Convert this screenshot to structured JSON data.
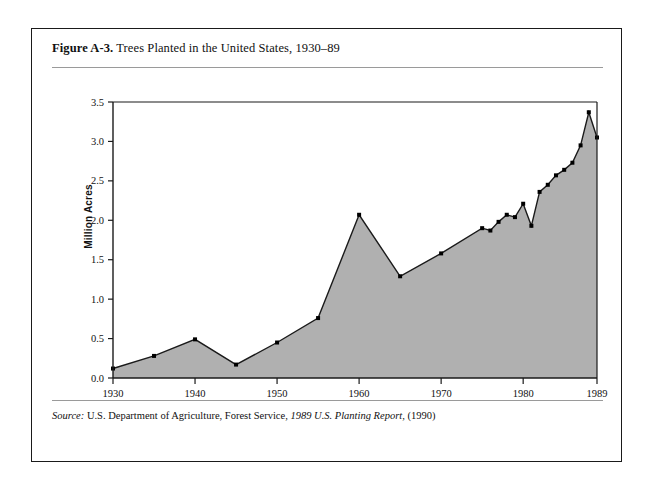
{
  "figure": {
    "label": "Figure A-3.",
    "title": "Trees Planted in the United States, 1930–89",
    "full_caption": "Figure A-3. Trees Planted in the United States, 1930–89"
  },
  "source": {
    "prefix": "Source:",
    "agency": "U.S. Department of Agriculture, Forest Service,",
    "publication": "1989 U.S. Planting Report,",
    "year": "(1990)",
    "full_text": "Source: U.S. Department of Agriculture, Forest Service, 1989 U.S. Planting Report, (1990)"
  },
  "colors": {
    "area_fill": "#b0b0b0",
    "line": "#1a1a1a",
    "marker": "#000000",
    "frame": "#1a1a1a",
    "rule": "#9a9a9a",
    "page_background": "#ffffff"
  },
  "chart_data": {
    "type": "area",
    "title": "Trees Planted in the United States, 1930–89",
    "xlabel": "",
    "ylabel": "Million Acres",
    "xlim": [
      1930,
      1989
    ],
    "ylim": [
      0.0,
      3.5
    ],
    "grid": false,
    "legend": false,
    "y_ticks": [
      "0.0",
      "0.5",
      "1.0",
      "1.5",
      "2.0",
      "2.5",
      "3.0",
      "3.5"
    ],
    "y_tick_values": [
      0.0,
      0.5,
      1.0,
      1.5,
      2.0,
      2.5,
      3.0,
      3.5
    ],
    "x_ticks": [
      "1930",
      "1940",
      "1950",
      "1960",
      "1970",
      "1980",
      "1989"
    ],
    "x_tick_values": [
      1930,
      1940,
      1950,
      1960,
      1970,
      1980,
      1989
    ],
    "series": [
      {
        "name": "Trees Planted",
        "units": "Million Acres",
        "x": [
          1930,
          1935,
          1940,
          1945,
          1950,
          1955,
          1960,
          1965,
          1970,
          1975,
          1976,
          1977,
          1978,
          1979,
          1980,
          1981,
          1982,
          1983,
          1984,
          1985,
          1986,
          1987,
          1988,
          1989
        ],
        "values": [
          0.12,
          0.28,
          0.49,
          0.17,
          0.45,
          0.76,
          2.07,
          1.29,
          1.58,
          1.9,
          1.87,
          1.98,
          2.07,
          2.04,
          2.21,
          1.93,
          2.36,
          2.45,
          2.57,
          2.64,
          2.73,
          2.95,
          3.37,
          3.05
        ]
      }
    ],
    "markers": {
      "shown_at": [
        1930,
        1935,
        1940,
        1945,
        1950,
        1955,
        1960,
        1965,
        1970,
        1975,
        1976,
        1977,
        1978,
        1979,
        1980,
        1981,
        1982,
        1983,
        1984,
        1985,
        1986,
        1987,
        1988,
        1989
      ],
      "style": "filled-square"
    }
  }
}
